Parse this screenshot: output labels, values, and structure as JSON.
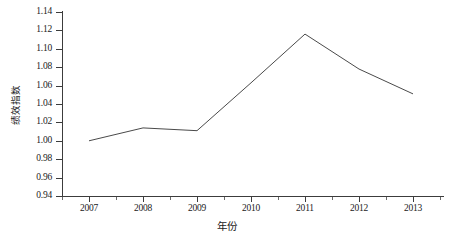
{
  "chart_data": {
    "type": "line",
    "title": "",
    "subtitle": "",
    "xlabel": "年份",
    "ylabel": "绩效指数",
    "categories": [
      "2007",
      "2008",
      "2009",
      "2010",
      "2011",
      "2012",
      "2013"
    ],
    "x": [
      2007,
      2008,
      2009,
      2010,
      2011,
      2012,
      2013
    ],
    "values": [
      1.0,
      1.014,
      1.011,
      1.063,
      1.116,
      1.078,
      1.051
    ],
    "series": [
      {
        "name": "绩效指数",
        "values": [
          1.0,
          1.014,
          1.011,
          1.063,
          1.116,
          1.078,
          1.051
        ]
      }
    ],
    "ylim": [
      0.94,
      1.14
    ],
    "xlim": [
      2006.5,
      2013.5
    ],
    "ytick_values": [
      0.94,
      0.96,
      0.98,
      1.0,
      1.02,
      1.04,
      1.06,
      1.08,
      1.1,
      1.12,
      1.14
    ],
    "ytick_labels": [
      "0.94",
      "0.96",
      "0.98",
      "1.00",
      "1.02",
      "1.04",
      "1.06",
      "1.08",
      "1.10",
      "1.12",
      "1.14"
    ],
    "xtick_labels": [
      "2007",
      "2008",
      "2009",
      "2010",
      "2011",
      "2012",
      "2013"
    ],
    "grid": false,
    "legend": false,
    "legend_position": "none",
    "line_color": "#4a4a4a",
    "background_color": "#ffffff",
    "axis_color": "#3c3c3c",
    "markers": false,
    "annotations": []
  }
}
